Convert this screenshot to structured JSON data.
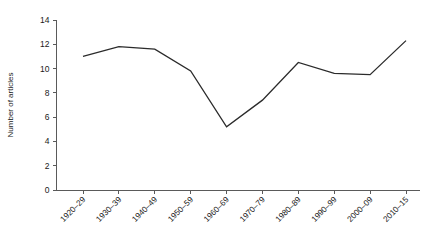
{
  "chart_data": {
    "type": "line",
    "title": "",
    "subtitle": "",
    "xlabel": "",
    "ylabel": "Number of articles",
    "categories": [
      "1920–29",
      "1930–39",
      "1940–49",
      "1950–59",
      "1960–69",
      "1970–79",
      "1980–89",
      "1990–99",
      "2000–09",
      "2010–15"
    ],
    "values": [
      11.0,
      11.8,
      11.6,
      9.8,
      5.2,
      7.4,
      10.5,
      9.6,
      9.5,
      12.3
    ],
    "series": [
      {
        "name": "Number of articles",
        "values": [
          11.0,
          11.8,
          11.6,
          9.8,
          5.2,
          7.4,
          10.5,
          9.6,
          9.5,
          12.3
        ]
      }
    ],
    "ylim": [
      0,
      14
    ],
    "yticks": [
      0,
      2,
      4,
      6,
      8,
      10,
      12,
      14
    ],
    "ytick_labels": [
      "0",
      "2",
      "4",
      "6",
      "8",
      "10",
      "12",
      "14"
    ],
    "grid": false,
    "legend": false,
    "legend_position": "none",
    "line_color": "#2b2b2b",
    "axis_color": "#5a5a5a",
    "background_color": "#ffffff",
    "markers": false,
    "x_tick_label_rotation": -45
  }
}
